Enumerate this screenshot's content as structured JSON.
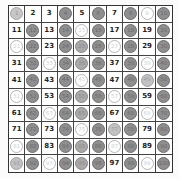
{
  "grid": {
    "rows": 10,
    "cols": 10,
    "start": 1,
    "end": 100
  },
  "legend": {
    "one": {
      "style": "light-gray-circle",
      "numbers": [
        1
      ]
    },
    "multiple_of_2": {
      "style": "dark-gray-circle",
      "color": "#8f8f8f"
    },
    "multiple_of_3": {
      "style": "white-outline-circle",
      "color": "#ffffff"
    },
    "multiple_of_5": {
      "style": "medium-gray-circle",
      "color": "#a9a9a9"
    },
    "multiple_of_7": {
      "style": "light-gray-circle",
      "color": "#c2c2c2"
    },
    "prime": {
      "style": "plain-number"
    }
  },
  "cells": [
    {
      "n": "1",
      "mark": "one"
    },
    {
      "n": "2",
      "mark": "prime"
    },
    {
      "n": "3",
      "mark": "prime"
    },
    {
      "n": "4",
      "mark": "m2"
    },
    {
      "n": "5",
      "mark": "prime"
    },
    {
      "n": "6",
      "mark": "m2"
    },
    {
      "n": "7",
      "mark": "prime"
    },
    {
      "n": "8",
      "mark": "m2"
    },
    {
      "n": "9",
      "mark": "m3"
    },
    {
      "n": "10",
      "mark": "m2"
    },
    {
      "n": "11",
      "mark": "prime"
    },
    {
      "n": "12",
      "mark": "m2"
    },
    {
      "n": "13",
      "mark": "prime"
    },
    {
      "n": "14",
      "mark": "m2"
    },
    {
      "n": "15",
      "mark": "m3"
    },
    {
      "n": "16",
      "mark": "m2"
    },
    {
      "n": "17",
      "mark": "prime"
    },
    {
      "n": "18",
      "mark": "m2"
    },
    {
      "n": "19",
      "mark": "prime"
    },
    {
      "n": "20",
      "mark": "m2"
    },
    {
      "n": "21",
      "mark": "m3"
    },
    {
      "n": "22",
      "mark": "m2"
    },
    {
      "n": "23",
      "mark": "prime"
    },
    {
      "n": "24",
      "mark": "m2"
    },
    {
      "n": "25",
      "mark": "m5"
    },
    {
      "n": "26",
      "mark": "m2"
    },
    {
      "n": "27",
      "mark": "m3"
    },
    {
      "n": "28",
      "mark": "m2"
    },
    {
      "n": "29",
      "mark": "prime"
    },
    {
      "n": "30",
      "mark": "m2"
    },
    {
      "n": "31",
      "mark": "prime"
    },
    {
      "n": "32",
      "mark": "m2"
    },
    {
      "n": "33",
      "mark": "m3"
    },
    {
      "n": "34",
      "mark": "m2"
    },
    {
      "n": "35",
      "mark": "m5"
    },
    {
      "n": "36",
      "mark": "m2"
    },
    {
      "n": "37",
      "mark": "prime"
    },
    {
      "n": "38",
      "mark": "m2"
    },
    {
      "n": "39",
      "mark": "m3"
    },
    {
      "n": "40",
      "mark": "m2"
    },
    {
      "n": "41",
      "mark": "prime"
    },
    {
      "n": "42",
      "mark": "m2"
    },
    {
      "n": "43",
      "mark": "prime"
    },
    {
      "n": "44",
      "mark": "m2"
    },
    {
      "n": "45",
      "mark": "m3"
    },
    {
      "n": "46",
      "mark": "m2"
    },
    {
      "n": "47",
      "mark": "prime"
    },
    {
      "n": "48",
      "mark": "m2"
    },
    {
      "n": "49",
      "mark": "m7"
    },
    {
      "n": "50",
      "mark": "m2"
    },
    {
      "n": "51",
      "mark": "m3"
    },
    {
      "n": "52",
      "mark": "m2"
    },
    {
      "n": "53",
      "mark": "prime"
    },
    {
      "n": "54",
      "mark": "m2"
    },
    {
      "n": "55",
      "mark": "m5"
    },
    {
      "n": "56",
      "mark": "m2"
    },
    {
      "n": "57",
      "mark": "m3"
    },
    {
      "n": "58",
      "mark": "m2"
    },
    {
      "n": "59",
      "mark": "prime"
    },
    {
      "n": "60",
      "mark": "m2"
    },
    {
      "n": "61",
      "mark": "prime"
    },
    {
      "n": "62",
      "mark": "m2"
    },
    {
      "n": "63",
      "mark": "m3"
    },
    {
      "n": "64",
      "mark": "m2"
    },
    {
      "n": "65",
      "mark": "m5"
    },
    {
      "n": "66",
      "mark": "m2"
    },
    {
      "n": "67",
      "mark": "prime"
    },
    {
      "n": "68",
      "mark": "m2"
    },
    {
      "n": "69",
      "mark": "m3"
    },
    {
      "n": "70",
      "mark": "m2"
    },
    {
      "n": "71",
      "mark": "prime"
    },
    {
      "n": "72",
      "mark": "m2"
    },
    {
      "n": "73",
      "mark": "prime"
    },
    {
      "n": "74",
      "mark": "m2"
    },
    {
      "n": "75",
      "mark": "m3"
    },
    {
      "n": "76",
      "mark": "m2"
    },
    {
      "n": "77",
      "mark": "m7"
    },
    {
      "n": "78",
      "mark": "m2"
    },
    {
      "n": "79",
      "mark": "prime"
    },
    {
      "n": "80",
      "mark": "m2"
    },
    {
      "n": "81",
      "mark": "m3"
    },
    {
      "n": "82",
      "mark": "m2"
    },
    {
      "n": "83",
      "mark": "prime"
    },
    {
      "n": "84",
      "mark": "m2"
    },
    {
      "n": "85",
      "mark": "m5"
    },
    {
      "n": "86",
      "mark": "m2"
    },
    {
      "n": "87",
      "mark": "m3"
    },
    {
      "n": "88",
      "mark": "m2"
    },
    {
      "n": "89",
      "mark": "prime"
    },
    {
      "n": "90",
      "mark": "m2"
    },
    {
      "n": "91",
      "mark": "m7"
    },
    {
      "n": "92",
      "mark": "m2"
    },
    {
      "n": "93",
      "mark": "m3"
    },
    {
      "n": "94",
      "mark": "m2"
    },
    {
      "n": "95",
      "mark": "m5"
    },
    {
      "n": "96",
      "mark": "m2"
    },
    {
      "n": "97",
      "mark": "prime"
    },
    {
      "n": "98",
      "mark": "m2"
    },
    {
      "n": "99",
      "mark": "m3"
    },
    {
      "n": "100",
      "mark": "m2"
    }
  ]
}
